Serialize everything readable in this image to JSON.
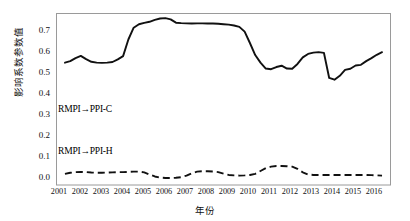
{
  "chart_data": {
    "type": "line",
    "title": "",
    "xlabel": "年份",
    "ylabel": "影响系数参数值",
    "xlim": [
      2000.6,
      2016.4
    ],
    "ylim": [
      -0.03,
      0.755
    ],
    "grid": false,
    "legend_position": "inline-annotation",
    "x_ticks": [
      "2001",
      "2002",
      "2003",
      "2004",
      "2005",
      "2006",
      "2007",
      "2008",
      "2009",
      "2010",
      "2011",
      "2012",
      "2013",
      "2014",
      "2015",
      "2016"
    ],
    "y_ticks": [
      "0.0",
      "0.1",
      "0.2",
      "0.3",
      "0.4",
      "0.5",
      "0.6",
      "0.7"
    ],
    "y_tick_values": [
      0.0,
      0.1,
      0.2,
      0.3,
      0.4,
      0.5,
      0.6,
      0.7
    ],
    "x": [
      2001.0,
      2001.25,
      2001.5,
      2001.75,
      2002.0,
      2002.25,
      2002.5,
      2002.75,
      2003.0,
      2003.25,
      2003.5,
      2003.75,
      2004.0,
      2004.25,
      2004.5,
      2004.75,
      2005.0,
      2005.25,
      2005.5,
      2005.75,
      2006.0,
      2006.25,
      2006.5,
      2006.75,
      2007.0,
      2007.25,
      2007.5,
      2007.75,
      2008.0,
      2008.25,
      2008.5,
      2008.75,
      2009.0,
      2009.25,
      2009.5,
      2009.75,
      2010.0,
      2010.25,
      2010.5,
      2010.75,
      2011.0,
      2011.25,
      2011.5,
      2011.75,
      2012.0,
      2012.25,
      2012.5,
      2012.75,
      2013.0,
      2013.25,
      2013.5,
      2013.75,
      2014.0,
      2014.25,
      2014.5,
      2014.75,
      2015.0,
      2015.25,
      2015.5,
      2015.75,
      2016.0
    ],
    "series": [
      {
        "name": "RMPI→PPI-C",
        "style": "solid",
        "color": "#111111",
        "label_text": "RMPI→PPI-C",
        "values": [
          0.53,
          0.537,
          0.551,
          0.561,
          0.546,
          0.534,
          0.53,
          0.529,
          0.53,
          0.533,
          0.545,
          0.56,
          0.636,
          0.69,
          0.706,
          0.712,
          0.717,
          0.726,
          0.732,
          0.734,
          0.728,
          0.713,
          0.711,
          0.71,
          0.709,
          0.71,
          0.71,
          0.709,
          0.709,
          0.708,
          0.706,
          0.704,
          0.7,
          0.694,
          0.672,
          0.62,
          0.565,
          0.53,
          0.503,
          0.5,
          0.51,
          0.516,
          0.503,
          0.502,
          0.524,
          0.554,
          0.57,
          0.576,
          0.578,
          0.575,
          0.46,
          0.452,
          0.47,
          0.497,
          0.502,
          0.517,
          0.52,
          0.537,
          0.551,
          0.566,
          0.578
        ]
      },
      {
        "name": "RMPI→PPI-H",
        "style": "dashed",
        "color": "#111111",
        "label_text": "RMPI→PPI-H",
        "values": [
          0.021,
          0.026,
          0.029,
          0.03,
          0.029,
          0.027,
          0.026,
          0.026,
          0.027,
          0.028,
          0.029,
          0.029,
          0.03,
          0.031,
          0.031,
          0.028,
          0.018,
          0.009,
          0.004,
          0.002,
          0.002,
          0.003,
          0.006,
          0.013,
          0.024,
          0.031,
          0.033,
          0.033,
          0.032,
          0.029,
          0.022,
          0.016,
          0.014,
          0.013,
          0.014,
          0.016,
          0.021,
          0.034,
          0.047,
          0.054,
          0.057,
          0.057,
          0.056,
          0.054,
          0.044,
          0.028,
          0.018,
          0.016,
          0.016,
          0.016,
          0.016,
          0.016,
          0.016,
          0.016,
          0.016,
          0.016,
          0.016,
          0.016,
          0.015,
          0.014,
          0.013
        ]
      }
    ],
    "annotations": [
      {
        "name": "solid-series-inline-label",
        "text": "RMPI→PPI-C",
        "x": 2001.0,
        "y": 0.5
      },
      {
        "name": "dashed-series-inline-label",
        "text": "RMPI→PPI-H",
        "x": 2001.0,
        "y": 0.1
      }
    ]
  }
}
